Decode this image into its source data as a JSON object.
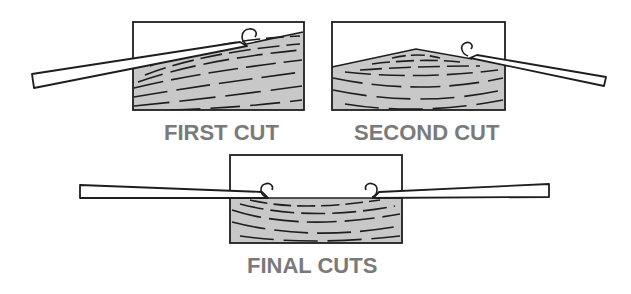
{
  "diagram": {
    "colors": {
      "wood": "#c8c8c8",
      "outline": "#1e1e1e",
      "label": "#7a7a7a",
      "background": "#ffffff"
    },
    "panels": [
      {
        "id": "first",
        "label": "FIRST CUT"
      },
      {
        "id": "second",
        "label": "SECOND CUT"
      },
      {
        "id": "final",
        "label": "FINAL CUTS"
      }
    ]
  }
}
